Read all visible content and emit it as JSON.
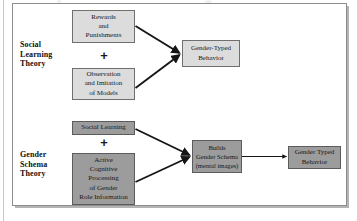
{
  "figure": {
    "type": "flow-diagram",
    "title": "",
    "rows": [
      {
        "id": "social-learning-theory",
        "label": "Social\nLearning\nTheory",
        "label_lines": [
          "Social",
          "Learning",
          "Theory"
        ],
        "style": "light",
        "inputs": [
          {
            "id": "rewards-and-punishments",
            "lines": [
              "Rewards",
              "and",
              "Punishments"
            ]
          },
          {
            "id": "observation-and-imitation",
            "lines": [
              "Observation",
              "and Imitation",
              "of Models"
            ]
          }
        ],
        "operator": "+",
        "outputs": [
          {
            "id": "gender-typed-behavior-slt",
            "lines": [
              "Gender-Typed",
              "Behavior"
            ]
          }
        ]
      },
      {
        "id": "gender-schema-theory",
        "label": "Gender\nSchema\nTheory",
        "label_lines": [
          "Gender",
          "Schema",
          "Theory"
        ],
        "style": "dark",
        "inputs": [
          {
            "id": "social-learning",
            "lines": [
              "Social Learning"
            ]
          },
          {
            "id": "active-cognitive-processing",
            "lines": [
              "Active",
              "Cognitive",
              "Processing",
              "of Gender",
              "Role Information"
            ]
          }
        ],
        "operator": "+",
        "outputs": [
          {
            "id": "builds-gender-schema",
            "lines": [
              "Builds",
              "Gender Schema",
              "(mental images)"
            ]
          },
          {
            "id": "gender-typed-behavior-gst",
            "lines": [
              "Gender Typed",
              "Behavior"
            ]
          }
        ]
      }
    ],
    "colors": {
      "light_fill": "#dcdcdc",
      "dark_fill": "#9c9c9c",
      "box_border": "#6f6f6f",
      "arrow": "#151515",
      "frame_border": "#8d8d8d",
      "page_background": "#ffffff"
    }
  },
  "row1": {
    "label_l1": "Social",
    "label_l2": "Learning",
    "label_l3": "Theory",
    "box_rewards": {
      "l1": "Rewards",
      "l2": "and",
      "l3": "Punishments"
    },
    "plus": "+",
    "box_observation": {
      "l1": "Observation",
      "l2": "and Imitation",
      "l3": "of Models"
    },
    "box_outcome": {
      "l1": "Gender-Typed",
      "l2": "Behavior"
    }
  },
  "row2": {
    "label_l1": "Gender",
    "label_l2": "Schema",
    "label_l3": "Theory",
    "box_social_learning": {
      "l1": "Social Learning"
    },
    "plus": "+",
    "box_active": {
      "l1": "Active",
      "l2": "Cognitive",
      "l3": "Processing",
      "l4": "of Gender",
      "l5": "Role Information"
    },
    "box_builds": {
      "l1": "Builds",
      "l2": "Gender Schema",
      "l3": "(mental images)"
    },
    "box_outcome": {
      "l1": "Gender Typed",
      "l2": "Behavior"
    }
  }
}
